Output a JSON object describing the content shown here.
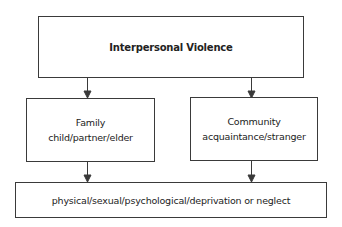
{
  "diagram": {
    "root": {
      "label": "Interpersonal Violence"
    },
    "branches": [
      {
        "title": "Family",
        "subtitle": "child/partner/elder"
      },
      {
        "title": "Community",
        "subtitle": "acquaintance/stranger"
      }
    ],
    "leaf": {
      "label": "physical/sexual/psychological/deprivation or neglect"
    },
    "edges": [
      {
        "from": "Interpersonal Violence",
        "to": "Family"
      },
      {
        "from": "Interpersonal Violence",
        "to": "Community"
      },
      {
        "from": "Family",
        "to": "physical/sexual/psychological/deprivation or neglect"
      },
      {
        "from": "Community",
        "to": "physical/sexual/psychological/deprivation or neglect"
      }
    ],
    "colors": {
      "stroke": "#3a3a3a",
      "text": "#222222",
      "background": "#ffffff"
    }
  }
}
